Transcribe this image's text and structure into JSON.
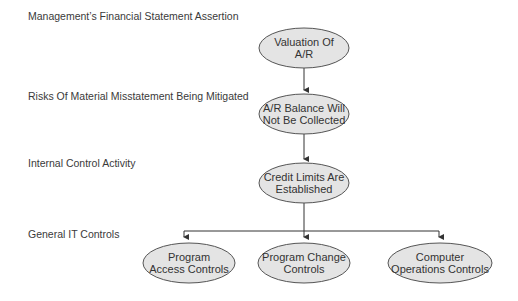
{
  "levels": [
    {
      "label": "Management’s Financial Statement Assertion"
    },
    {
      "label": "Risks Of Material Misstatement Being Mitigated"
    },
    {
      "label": "Internal Control Activity"
    },
    {
      "label": "General IT Controls"
    }
  ],
  "nodes": {
    "assertion": {
      "line1": "Valuation Of",
      "line2": "A/R"
    },
    "risk": {
      "line1": "A/R Balance Will",
      "line2": "Not Be Collected"
    },
    "control": {
      "line1": "Credit Limits Are",
      "line2": "Established"
    },
    "it_controls": [
      {
        "line1": "Program",
        "line2": "Access Controls"
      },
      {
        "line1": "Program Change",
        "line2": "Controls"
      },
      {
        "line1": "Computer",
        "line2": "Operations Controls"
      }
    ]
  },
  "colors": {
    "node_fill": "#e4e4e4",
    "node_stroke": "#555555",
    "connector": "#333333"
  }
}
